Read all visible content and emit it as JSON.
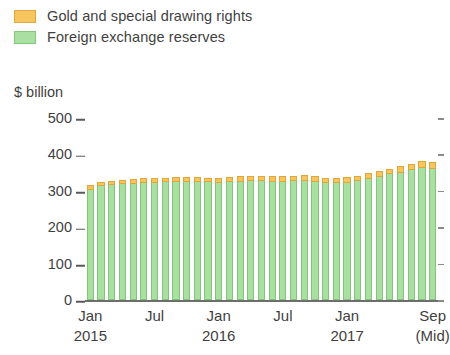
{
  "legend": {
    "position": "top-left",
    "items": [
      {
        "label": "Gold and special drawing rights",
        "color": "#f7c55e",
        "swatch": "gold-swatch"
      },
      {
        "label": "Foreign exchange reserves",
        "color": "#a9e0a1",
        "swatch": "green-swatch"
      }
    ]
  },
  "axis": {
    "y_title": "$ billion",
    "y_ticks": [
      "0",
      "100",
      "200",
      "300",
      "400",
      "500"
    ],
    "x_labels": [
      {
        "line1": "Jan",
        "line2": "2015"
      },
      {
        "line1": "Jul",
        "line2": ""
      },
      {
        "line1": "Jan",
        "line2": "2016"
      },
      {
        "line1": "Jul",
        "line2": ""
      },
      {
        "line1": "Jan",
        "line2": "2017"
      },
      {
        "line1": "Sep",
        "line2": "(Mid)"
      }
    ]
  },
  "chart_data": {
    "type": "bar",
    "stacked": true,
    "title": "",
    "subtitle": "",
    "xlabel": "",
    "ylabel": "$ billion",
    "ylim": [
      0,
      500
    ],
    "ytick_values": [
      0,
      100,
      200,
      300,
      400,
      500
    ],
    "grid": false,
    "legend_position": "top-left",
    "x_tick_labels": [
      "Jan 2015",
      "Jul",
      "Jan 2016",
      "Jul",
      "Jan 2017",
      "Sep (Mid)"
    ],
    "x_tick_indices": [
      0,
      6,
      12,
      18,
      24,
      32
    ],
    "categories": [
      "Jan 2015",
      "Feb 2015",
      "Mar 2015",
      "Apr 2015",
      "May 2015",
      "Jun 2015",
      "Jul 2015",
      "Aug 2015",
      "Sep 2015",
      "Oct 2015",
      "Nov 2015",
      "Dec 2015",
      "Jan 2016",
      "Feb 2016",
      "Mar 2016",
      "Apr 2016",
      "May 2016",
      "Jun 2016",
      "Jul 2016",
      "Aug 2016",
      "Sep 2016",
      "Oct 2016",
      "Nov 2016",
      "Dec 2016",
      "Jan 2017",
      "Feb 2017",
      "Mar 2017",
      "Apr 2017",
      "May 2017",
      "Jun 2017",
      "Jul 2017",
      "Aug 2017",
      "Sep 2017"
    ],
    "series": [
      {
        "name": "Foreign exchange reserves",
        "color": "#a9e0a1",
        "values": [
          303,
          312,
          315,
          318,
          320,
          322,
          322,
          323,
          324,
          325,
          324,
          323,
          322,
          323,
          325,
          327,
          326,
          325,
          324,
          326,
          327,
          325,
          322,
          321,
          322,
          327,
          332,
          338,
          345,
          350,
          357,
          363,
          361
        ]
      },
      {
        "name": "Gold and special drawing rights",
        "color": "#f7c55e",
        "values": [
          12,
          13,
          13,
          13,
          13,
          13,
          13,
          13,
          13,
          13,
          13,
          13,
          14,
          15,
          15,
          15,
          15,
          15,
          16,
          16,
          16,
          15,
          14,
          14,
          15,
          15,
          16,
          16,
          16,
          17,
          18,
          19,
          19
        ]
      }
    ],
    "totals": [
      315,
      325,
      328,
      331,
      333,
      335,
      335,
      336,
      337,
      338,
      337,
      336,
      336,
      338,
      340,
      342,
      341,
      340,
      340,
      342,
      343,
      340,
      336,
      335,
      337,
      342,
      348,
      354,
      361,
      367,
      375,
      382,
      380
    ]
  }
}
